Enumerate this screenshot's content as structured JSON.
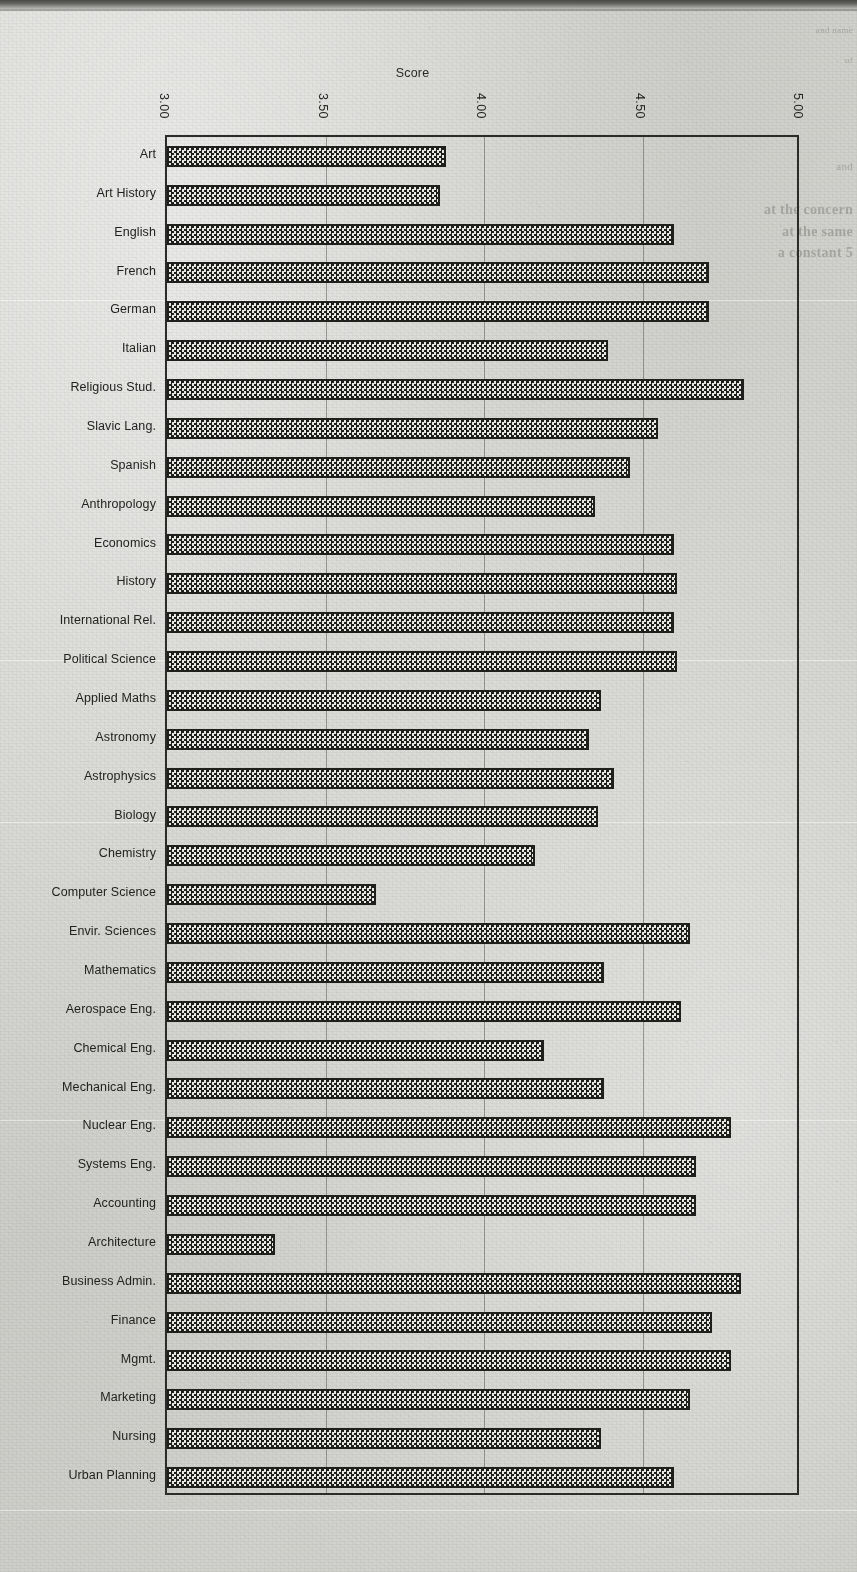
{
  "page": {
    "bleed_through_text": [
      "and name",
      "of",
      "and",
      "at the concern",
      "at the same",
      "a constant 5"
    ]
  },
  "chart_data": {
    "type": "bar",
    "orientation": "horizontal",
    "title": "Score",
    "xlabel": "",
    "ylabel": "",
    "xlim": [
      3.0,
      5.0
    ],
    "xticks": [
      3.0,
      3.5,
      4.0,
      4.5,
      5.0
    ],
    "xtick_labels": [
      "3.00",
      "3.50",
      "4.00",
      "4.50",
      "5.00"
    ],
    "grid": true,
    "grid_axis": "x",
    "legend": null,
    "bar_fill": "checkerboard-hatch",
    "bar_edge_color": "#1f1f1e",
    "categories": [
      "Art",
      "Art History",
      "English",
      "French",
      "German",
      "Italian",
      "Religious Stud.",
      "Slavic Lang.",
      "Spanish",
      "Anthropology",
      "Economics",
      "History",
      "International Rel.",
      "Political  Science",
      "Applied Maths",
      "Astronomy",
      "Astrophysics",
      "Biology",
      "Chemistry",
      "Computer Science",
      "Envir. Sciences",
      "Mathematics",
      "Aerospace Eng.",
      "Chemical Eng.",
      "Mechanical Eng.",
      "Nuclear  Eng.",
      "Systems Eng.",
      "Accounting",
      "Architecture",
      "Business Admin.",
      "Finance",
      "Mgmt.",
      "Marketing",
      "Nursing",
      "Urban Planning"
    ],
    "values": [
      3.88,
      3.86,
      4.6,
      4.71,
      4.71,
      4.39,
      4.82,
      4.55,
      4.46,
      4.35,
      4.6,
      4.61,
      4.6,
      4.61,
      4.37,
      4.33,
      4.41,
      4.36,
      4.16,
      3.66,
      4.65,
      4.38,
      4.62,
      4.19,
      4.38,
      4.78,
      4.67,
      4.67,
      3.34,
      4.81,
      4.72,
      4.78,
      4.65,
      4.37,
      4.6
    ]
  }
}
